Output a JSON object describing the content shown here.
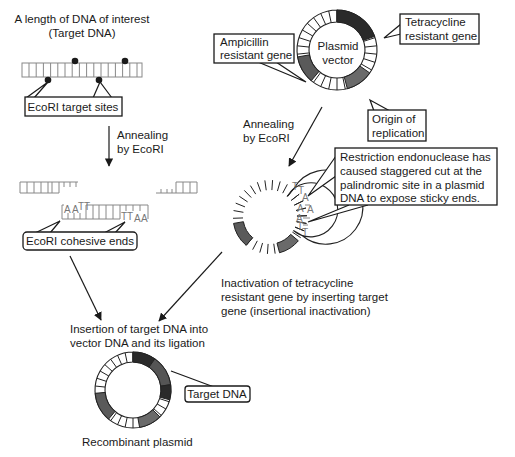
{
  "diagram": {
    "target_dna": {
      "heading_line1": "A length of DNA of interest",
      "heading_line2": "(Target DNA)",
      "sites_label": "EcoRI target sites"
    },
    "step1": {
      "label_line1": "Annealing",
      "label_line2": "by EcoRI"
    },
    "cohesive": {
      "label": "EcoRI cohesive ends",
      "top_bases": [
        "A",
        "A",
        "T",
        "T"
      ],
      "bottom_bases": [
        "T",
        "T",
        "A",
        "A"
      ]
    },
    "plasmid_vector": {
      "center_label_line1": "Plasmid",
      "center_label_line2": "vector",
      "amp_label_line1": "Ampicillin",
      "amp_label_line2": "resistant gene",
      "tet_label_line1": "Tetracycline",
      "tet_label_line2": "resistant gene",
      "ori_label_line1": "Origin of",
      "ori_label_line2": "replication"
    },
    "step2": {
      "label_line1": "Annealing",
      "label_line2": "by EcoRI"
    },
    "cut_plasmid": {
      "sticky_bases": [
        "T",
        "T",
        "A",
        "A",
        "A",
        "A",
        "T",
        "T"
      ],
      "callout_line1": "Restriction endonuclease has",
      "callout_line2": "caused staggered cut at the",
      "callout_line3": "palindromic site in a plasmid",
      "callout_line4": "DNA to expose sticky ends.",
      "caption_line1": "Inactivation of tetracycline",
      "caption_line2": "resistant gene by inserting target",
      "caption_line3": "gene (insertional inactivation)"
    },
    "insertion": {
      "label_line1": "Insertion of target DNA into",
      "label_line2": "vector DNA and its ligation"
    },
    "recombinant": {
      "target_label": "Target DNA",
      "caption": "Recombinant plasmid"
    },
    "colors": {
      "tet_gene": "#2a2a2a",
      "amp_gene": "#5a5a5a",
      "ori": "#6a6a6a",
      "target_dna": "#555555",
      "dna_strand": "#888888",
      "text": "#1a1a1a"
    }
  }
}
